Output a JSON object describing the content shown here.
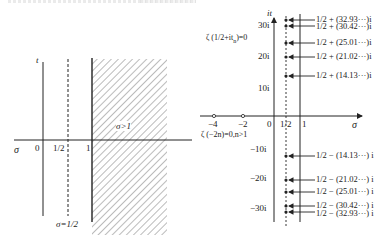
{
  "left_diagram": {
    "axis_x_label": "σ",
    "axis_y_label": "t",
    "tick_0": "0",
    "tick_half": "1/2",
    "tick_1": "1",
    "region_label": "σ>1",
    "critical_line_label": "σ=1/2"
  },
  "right_diagram": {
    "axis_x_label": "σ",
    "axis_y_label": "it",
    "x_ticks": [
      "−4",
      "−2",
      "0",
      "1/2",
      "1"
    ],
    "y_ticks_pos": [
      "30i",
      "20i",
      "10i"
    ],
    "y_ticks_neg": [
      "−10i",
      "−20i",
      "−30i"
    ],
    "nontrivial_zero_label": "ζ (1/2+it",
    "nontrivial_zero_sub": "n",
    "nontrivial_zero_tail": ")=0",
    "trivial_zero_label": "ζ (−2n)=0,n>1",
    "zeros_upper": [
      "1/2 + (32.93···)i",
      "1/2 + (30.42···)i",
      "1/2 + (25.01···)i",
      "1/2 + (21.02···)i",
      "1/2 + (14.13···)i"
    ],
    "zeros_lower": [
      "1/2 − (14.13···) i",
      "1/2 − (21.02···) i",
      "1/2 − (25.01···) i",
      "1/2 − (30.42···) i",
      "1/2 − (32.93···) i"
    ]
  }
}
